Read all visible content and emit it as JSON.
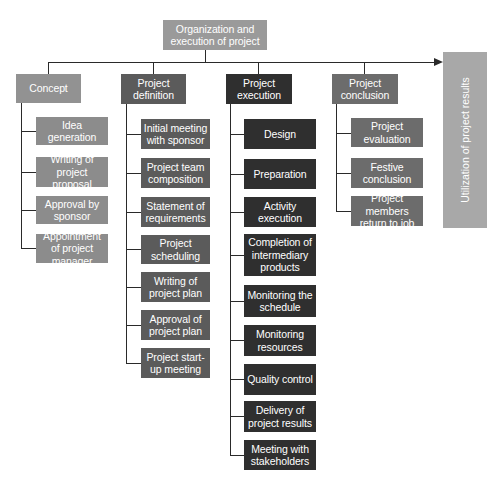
{
  "title": "Organization and execution of project",
  "outcome": "Utilization of project results",
  "colors": {
    "root": "#9a9a9a",
    "concept": "#929292",
    "definition": "#5b5b5b",
    "execution": "#2f2f2f",
    "conclusion": "#6c6c6c",
    "outcome": "#a8a8a8",
    "lines": "#2a2a2a"
  },
  "phases": [
    {
      "label": "Concept",
      "items": [
        "Idea generation",
        "Writing of project proposal",
        "Approval by sponsor",
        "Appointment of project manager"
      ]
    },
    {
      "label": "Project definition",
      "items": [
        "Initial meeting with sponsor",
        "Project team composition",
        "Statement of requirements",
        "Project scheduling",
        "Writing of project plan",
        "Approval of project plan",
        "Project start-up meeting"
      ]
    },
    {
      "label": "Project execution",
      "items": [
        "Design",
        "Preparation",
        "Activity execution",
        "Completion of intermediary products",
        "Monitoring the schedule",
        "Monitoring resources",
        "Quality control",
        "Delivery of project results",
        "Meeting with stakeholders"
      ]
    },
    {
      "label": "Project conclusion",
      "items": [
        "Project evaluation",
        "Festive conclusion",
        "Project members return to job"
      ]
    }
  ]
}
